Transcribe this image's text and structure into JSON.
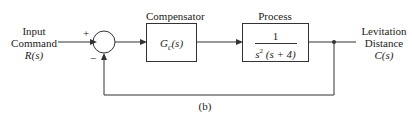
{
  "diagram": {
    "input": {
      "line1": "Input",
      "line2": "Command",
      "line3": "R(s)"
    },
    "output": {
      "line1": "Levitation",
      "line2": "Distance",
      "line3": "C(s)"
    },
    "summing_junction": {
      "plus": "+",
      "minus": "−"
    },
    "compensator": {
      "title": "Compensator",
      "tf": "G",
      "tf_sub": "c",
      "tf_arg": "(s)"
    },
    "process": {
      "title": "Process",
      "numerator": "1",
      "denominator_s": "s",
      "denominator_exp": "2",
      "denominator_rest": " (s + 4)"
    },
    "caption": "(b)"
  }
}
